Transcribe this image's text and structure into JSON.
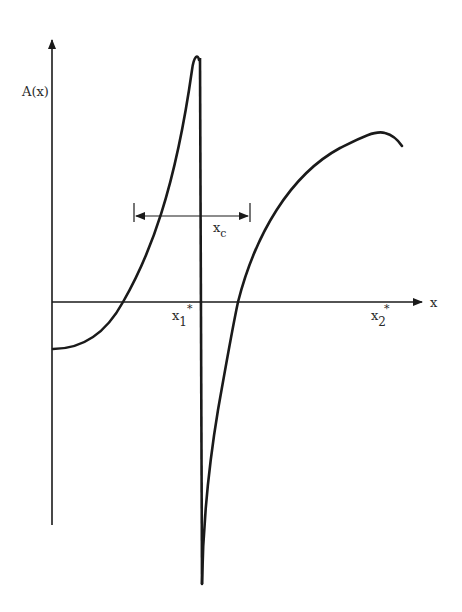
{
  "diagram": {
    "y_axis_label": "A(x)",
    "x_axis_label": "x",
    "interval_label": "x",
    "interval_label_sub": "c",
    "point1_label": "x",
    "point1_sub": "1",
    "point1_sup": "*",
    "point2_label": "x",
    "point2_sub": "2",
    "point2_sup": "*",
    "colors": {
      "stroke": "#1a1a1a",
      "background": "#ffffff"
    }
  }
}
